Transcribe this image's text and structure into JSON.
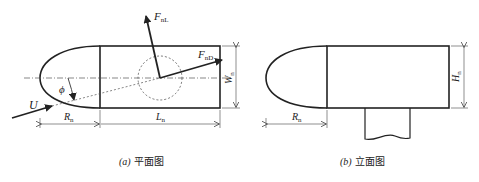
{
  "plan_view": {
    "caption_prefix": "(a)",
    "caption": "平面图",
    "labels": {
      "lift_force": "F",
      "lift_force_sub": "nL",
      "drag_force": "F",
      "drag_force_sub": "nD",
      "flow_velocity": "U",
      "angle": "ϕ",
      "nose_length": "R",
      "nose_length_sub": "n",
      "body_length": "L",
      "body_length_sub": "n",
      "width": "W",
      "width_sub": "n"
    }
  },
  "elevation_view": {
    "caption_prefix": "(b)",
    "caption": "立面图",
    "labels": {
      "nose_length": "R",
      "nose_length_sub": "n",
      "height": "H",
      "height_sub": "n"
    }
  }
}
